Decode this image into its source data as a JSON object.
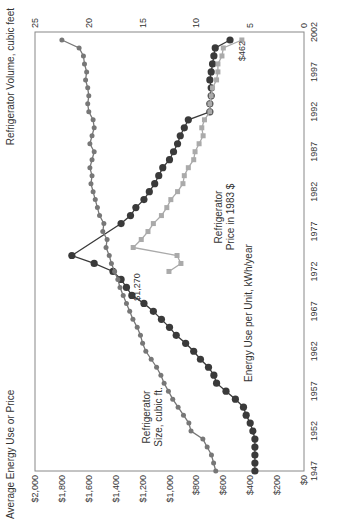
{
  "chart_data": {
    "type": "line",
    "orientation": "rotated-90-ccw",
    "title": "",
    "xlabel": "",
    "ylabel_left": "Average Energy Use or Price",
    "ylabel_right": "Refrigerator Volume, cubic feet",
    "xlim": [
      1947,
      2002
    ],
    "ylim_left": [
      0,
      2000
    ],
    "ylim_right": [
      0,
      25
    ],
    "x_ticks": [
      "1947",
      "1952",
      "1957",
      "1962",
      "1967",
      "1972",
      "1977",
      "1982",
      "1987",
      "1992",
      "1997",
      "2002"
    ],
    "y_left_ticks": [
      "$0",
      "$200",
      "$400",
      "$600",
      "$800",
      "$1,000",
      "$1,200",
      "$1,400",
      "$1,600",
      "$1,800",
      "$2,000"
    ],
    "y_right_ticks": [
      "0",
      "5",
      "10",
      "15",
      "20",
      "25"
    ],
    "grid": false,
    "series": [
      {
        "name": "Energy Use per Unit, kWh/year",
        "axis": "left",
        "color": "#3a3a3a",
        "x": [
          1947,
          1948,
          1949,
          1950,
          1951,
          1952,
          1953,
          1954,
          1955,
          1956,
          1957,
          1958,
          1959,
          1960,
          1961,
          1962,
          1963,
          1964,
          1965,
          1966,
          1967,
          1968,
          1969,
          1970,
          1971,
          1972,
          1973,
          1974,
          1978,
          1979,
          1980,
          1981,
          1982,
          1983,
          1984,
          1985,
          1986,
          1987,
          1988,
          1989,
          1990,
          1991,
          1992,
          1993,
          1994,
          1995,
          1996,
          1997,
          1998,
          1999,
          2000,
          2001
        ],
        "values": [
          365,
          365,
          365,
          365,
          365,
          380,
          400,
          430,
          450,
          510,
          580,
          650,
          670,
          710,
          770,
          820,
          880,
          950,
          1000,
          1060,
          1120,
          1190,
          1280,
          1320,
          1360,
          1420,
          1560,
          1726,
          1360,
          1290,
          1250,
          1190,
          1150,
          1110,
          1080,
          1050,
          1000,
          970,
          940,
          920,
          890,
          860,
          700,
          700,
          690,
          690,
          700,
          690,
          680,
          670,
          660,
          550
        ]
      },
      {
        "name": "Refrigerator Price in 1983 $",
        "axis": "left",
        "color": "#aaaaaa",
        "x": [
          1972,
          1973,
          1974,
          1975,
          1976,
          1977,
          1978,
          1979,
          1980,
          1981,
          1982,
          1983,
          1984,
          1985,
          1986,
          1987,
          1988,
          1989,
          1990,
          1991,
          1992,
          1993,
          1994,
          1995,
          1996,
          1997,
          1998,
          1999,
          2000,
          2001
        ],
        "values": [
          1004,
          915,
          944,
          1270,
          1210,
          1160,
          1120,
          1060,
          1020,
          990,
          940,
          900,
          890,
          860,
          820,
          810,
          780,
          750,
          760,
          740,
          700,
          700,
          690,
          680,
          650,
          640,
          640,
          610,
          600,
          462
        ]
      },
      {
        "name": "Refrigerator Size, cubic ft.",
        "axis": "right",
        "color": "#777777",
        "x": [
          1947,
          1948,
          1949,
          1950,
          1951,
          1952,
          1953,
          1954,
          1955,
          1956,
          1957,
          1958,
          1959,
          1960,
          1961,
          1962,
          1963,
          1964,
          1965,
          1966,
          1967,
          1968,
          1969,
          1970,
          1971,
          1972,
          1973,
          1974,
          1975,
          1976,
          1977,
          1978,
          1979,
          1980,
          1981,
          1982,
          1983,
          1984,
          1985,
          1986,
          1987,
          1988,
          1989,
          1990,
          1991,
          1992,
          1993,
          1994,
          1995,
          1996,
          1997,
          1998,
          1999,
          2000,
          2001
        ],
        "values": [
          8.2,
          8.4,
          8.6,
          9.0,
          9.4,
          10.5,
          10.7,
          11.2,
          11.7,
          12.2,
          12.6,
          13.0,
          13.3,
          13.7,
          14.2,
          14.7,
          15.0,
          15.2,
          15.5,
          15.9,
          16.2,
          16.5,
          16.8,
          17.1,
          17.3,
          17.6,
          17.9,
          18.1,
          18.4,
          18.3,
          18.7,
          18.6,
          19.0,
          19.2,
          19.4,
          19.6,
          19.8,
          19.7,
          19.9,
          19.7,
          19.5,
          19.9,
          19.7,
          19.5,
          19.6,
          20.0,
          20.1,
          20.0,
          20.1,
          20.3,
          20.2,
          20.4,
          20.5,
          20.9,
          22.5
        ]
      }
    ],
    "annotations": [
      {
        "text": "$1,270",
        "x": 1975,
        "value": 1270
      },
      {
        "text": "$462",
        "x": 2001,
        "value": 462
      },
      {
        "text": "Refrigerator Size, cubic ft."
      },
      {
        "text": "Energy Use per Unit, kWh/year"
      },
      {
        "text": "Refrigerator Price in 1983 $"
      }
    ],
    "legend": "inline-labels"
  },
  "labels": {
    "left_axis_title": "Average Energy Use or Price",
    "right_axis_title": "Refrigerator Volume, cubic feet",
    "size_label_1": "Refrigerator",
    "size_label_2": "Size, cubic ft.",
    "energy_label": "Energy Use per Unit, kWh/year",
    "price_label_1": "Refrigerator",
    "price_label_2": "Price in 1983 $",
    "price_peak": "$1,270",
    "price_end": "$462"
  }
}
